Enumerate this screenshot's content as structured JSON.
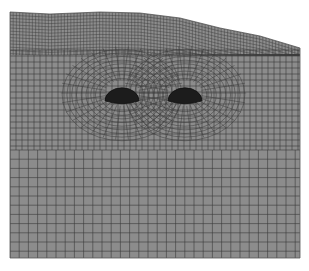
{
  "figure": {
    "type": "finite-element-mesh",
    "background": "#ffffff",
    "mesh_fill": "#8c8c8c",
    "line_color": "#3a3a3a",
    "opening_color": "#1c1c1c",
    "domain": {
      "left": 10,
      "right": 300,
      "bottom": 258,
      "surface": [
        [
          10,
          12
        ],
        [
          50,
          14
        ],
        [
          100,
          12
        ],
        [
          140,
          13
        ],
        [
          180,
          18
        ],
        [
          220,
          28
        ],
        [
          260,
          36
        ],
        [
          300,
          48
        ]
      ]
    },
    "openings": [
      {
        "name": "left-tunnel",
        "cx": 122,
        "cy": 93,
        "rx": 17,
        "ry": 13
      },
      {
        "name": "right-tunnel",
        "cx": 185,
        "cy": 93,
        "rx": 17,
        "ry": 13
      }
    ]
  }
}
